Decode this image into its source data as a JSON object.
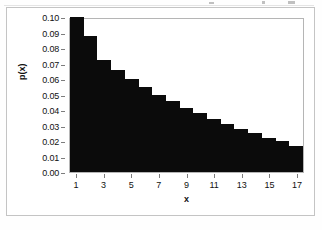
{
  "chart_data": {
    "type": "bar",
    "title": "",
    "xlabel": "x",
    "ylabel": "p(x)",
    "categories": [
      1,
      2,
      3,
      4,
      5,
      6,
      7,
      8,
      9,
      10,
      11,
      12,
      13,
      14,
      15,
      16,
      17
    ],
    "values": [
      0.1,
      0.088,
      0.072,
      0.066,
      0.06,
      0.055,
      0.05,
      0.046,
      0.041,
      0.038,
      0.034,
      0.031,
      0.028,
      0.025,
      0.022,
      0.02,
      0.017
    ],
    "series": [
      {
        "name": "p(x)",
        "values": [
          0.1,
          0.088,
          0.072,
          0.066,
          0.06,
          0.055,
          0.05,
          0.046,
          0.041,
          0.038,
          0.034,
          0.031,
          0.028,
          0.025,
          0.022,
          0.02,
          0.017
        ]
      }
    ],
    "ylim": [
      0.0,
      0.1
    ],
    "ytick_labels": [
      "0.10",
      "0.09",
      "0.08",
      "0.07",
      "0.06",
      "0.05",
      "0.04",
      "0.03",
      "0.02",
      "0.01",
      "0.00"
    ],
    "ytick_values": [
      0.1,
      0.09,
      0.08,
      0.07,
      0.06,
      0.05,
      0.04,
      0.03,
      0.02,
      0.01,
      0.0
    ],
    "xtick_labels": [
      "1",
      "3",
      "5",
      "7",
      "9",
      "11",
      "13",
      "15",
      "17"
    ],
    "xtick_values": [
      1,
      3,
      5,
      7,
      9,
      11,
      13,
      15,
      17
    ],
    "xlim": [
      0.5,
      17.5
    ],
    "grid": false,
    "legend": null,
    "bar_color": "#0b0b0b",
    "bar_gap": 0,
    "plot_border_color": "#b5b5b5",
    "chart_border_color": "#c4c4c4",
    "background_color": "#ffffff"
  }
}
